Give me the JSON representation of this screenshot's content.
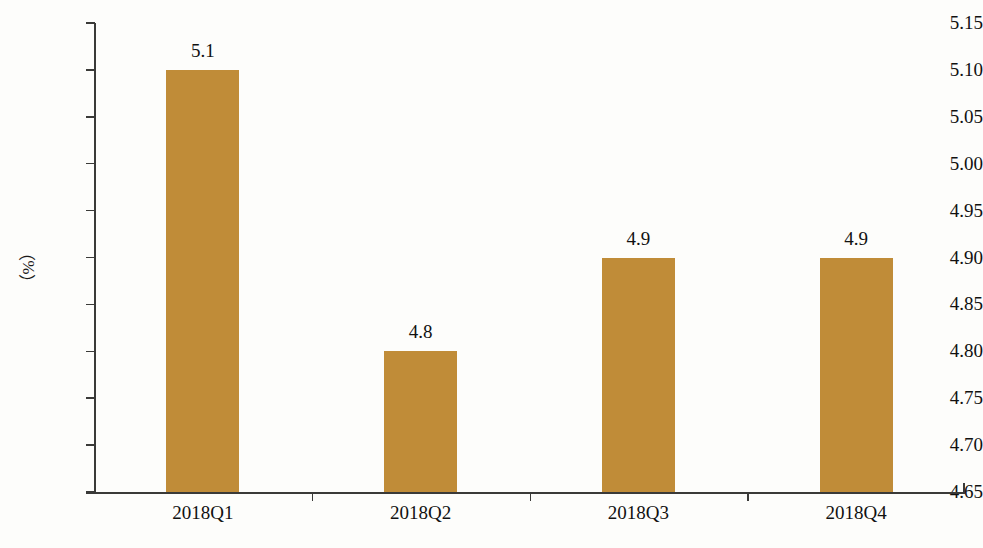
{
  "chart_data": {
    "type": "bar",
    "title": "",
    "subtitle": "",
    "xlabel": "",
    "ylabel": "（%）",
    "categories": [
      "2018Q1",
      "2018Q2",
      "2018Q3",
      "2018Q4"
    ],
    "values": [
      5.1,
      4.8,
      4.9,
      4.9
    ],
    "data_labels": [
      "5.1",
      "4.8",
      "4.9",
      "4.9"
    ],
    "ylim": [
      4.65,
      5.15
    ],
    "ytick_step": 0.05,
    "ytick_labels": [
      "5.15",
      "5.10",
      "5.05",
      "5.00",
      "4.95",
      "4.90",
      "4.85",
      "4.80",
      "4.75",
      "4.70",
      "4.65"
    ],
    "ytick_values": [
      5.15,
      5.1,
      5.05,
      5.0,
      4.95,
      4.9,
      4.85,
      4.8,
      4.75,
      4.7,
      4.65
    ],
    "grid": false,
    "legend": false,
    "legend_position": "none",
    "bar_color": "#c08c38",
    "axis_color": "#3a3a38",
    "background_color": "#fdfdfb",
    "text_color": "#111111",
    "series": [
      {
        "name": "",
        "values": [
          5.1,
          4.8,
          4.9,
          4.9
        ]
      }
    ]
  }
}
